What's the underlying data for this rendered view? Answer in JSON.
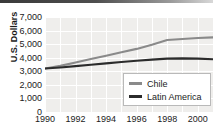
{
  "chart_data": {
    "type": "line",
    "title": "",
    "subtitle": "",
    "xlabel": "",
    "ylabel": "U.S. Dollars",
    "xlim": [
      1990,
      2001
    ],
    "ylim": [
      0,
      7000
    ],
    "grid": true,
    "legend_position": "bottom-right",
    "y_ticks": [
      "7,000",
      "6,000",
      "5,000",
      "4,000",
      "3,000",
      "2,000",
      "1,000",
      "0"
    ],
    "y_tick_values": [
      7000,
      6000,
      5000,
      4000,
      3000,
      2000,
      1000,
      0
    ],
    "x_ticks": [
      "1990",
      "1992",
      "1994",
      "1996",
      "1998",
      "2000"
    ],
    "x_tick_values": [
      1990,
      1992,
      1994,
      1996,
      1998,
      2000
    ],
    "x": [
      1990,
      1991,
      1992,
      1993,
      1994,
      1995,
      1996,
      1997,
      1998,
      1999,
      2000,
      2001
    ],
    "series": [
      {
        "name": "Chile",
        "color": "#8a8a8a",
        "values": [
          3200,
          3400,
          3650,
          3900,
          4150,
          4400,
          4650,
          4950,
          5300,
          5380,
          5450,
          5500
        ]
      },
      {
        "name": "Latin America",
        "color": "#2b2b2b",
        "values": [
          3200,
          3280,
          3380,
          3480,
          3580,
          3680,
          3780,
          3860,
          3930,
          3950,
          3930,
          3890
        ]
      }
    ]
  },
  "legend": {
    "entries": [
      {
        "label": "Chile",
        "color": "#8a8a8a"
      },
      {
        "label": "Latin America",
        "color": "#2b2b2b"
      }
    ]
  },
  "colors": {
    "plot_background": "#efeeec",
    "gridline": "#ffffff",
    "text": "#1b1b1b",
    "legend_border": "#b9b9b9",
    "chile_line": "#8a8a8a",
    "latin_america_line": "#2b2b2b"
  }
}
